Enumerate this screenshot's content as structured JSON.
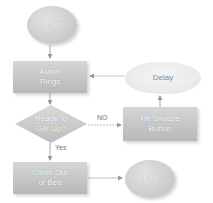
{
  "diagram": {
    "type": "flowchart",
    "colors": {
      "node_fill": "#c8c8c8",
      "cloud_fill": "#ececec",
      "text": "#ffffff",
      "cloud_text": "#8a8a8a",
      "edge": "#a0a0a0",
      "edge_label": "#777777"
    },
    "nodes": {
      "start": {
        "label": "Start",
        "shape": "ellipse"
      },
      "alarm": {
        "label_line1": "Alarm",
        "label_line2": "Rings",
        "shape": "rectangle"
      },
      "delay": {
        "label": "Delay",
        "shape": "cloud"
      },
      "ready": {
        "label_line1": "Ready to",
        "label_line2": "Get Up?",
        "shape": "diamond"
      },
      "snooze": {
        "label_line1": "Hit Snooze",
        "label_line2": "Button",
        "shape": "rectangle"
      },
      "climb": {
        "label_line1": "Climb Out",
        "label_line2": "of Bed",
        "shape": "rectangle"
      },
      "end": {
        "label": "End",
        "shape": "ellipse"
      }
    },
    "edges": [
      {
        "from": "start",
        "to": "alarm",
        "label": ""
      },
      {
        "from": "alarm",
        "to": "ready",
        "label": ""
      },
      {
        "from": "ready",
        "to": "snooze",
        "label": "NO"
      },
      {
        "from": "snooze",
        "to": "delay",
        "label": ""
      },
      {
        "from": "delay",
        "to": "alarm",
        "label": ""
      },
      {
        "from": "ready",
        "to": "climb",
        "label": "Yes"
      },
      {
        "from": "climb",
        "to": "end",
        "label": ""
      }
    ],
    "edge_labels": {
      "no": "NO",
      "yes": "Yes"
    }
  }
}
